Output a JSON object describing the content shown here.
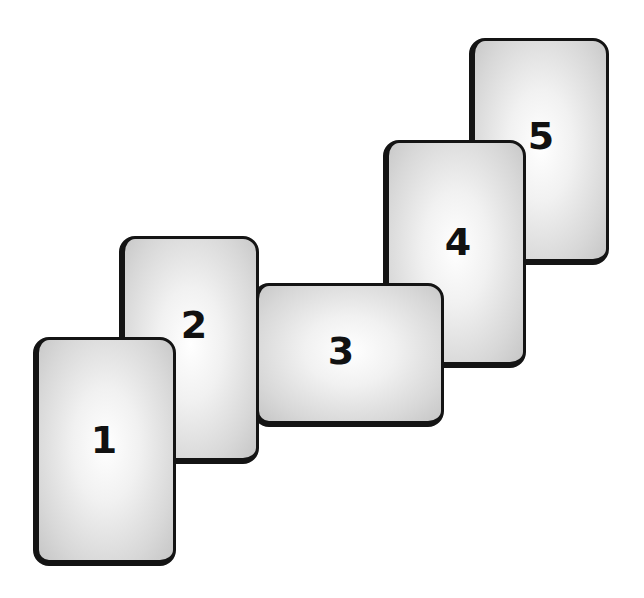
{
  "diagram": {
    "colors": {
      "background": "#ffffff",
      "card_border": "#141414",
      "card_fill_center": "#ffffff",
      "card_fill_edge": "#c6c6c6",
      "label": "#111111"
    },
    "cards": [
      {
        "label": "1",
        "orientation": "portrait"
      },
      {
        "label": "2",
        "orientation": "portrait"
      },
      {
        "label": "3",
        "orientation": "landscape"
      },
      {
        "label": "4",
        "orientation": "portrait"
      },
      {
        "label": "5",
        "orientation": "portrait"
      }
    ]
  }
}
